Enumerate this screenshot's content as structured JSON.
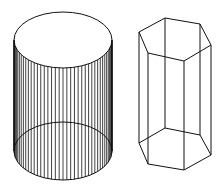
{
  "figure": {
    "width": 219,
    "height": 186,
    "background": "#ffffff",
    "stroke_color": "#111111",
    "shapes": [
      {
        "name": "cylinder",
        "type": "wireframe-cylinder",
        "cx": 63,
        "rx": 49,
        "top": {
          "cy": 40,
          "ry": 28
        },
        "bottom": {
          "cy": 151,
          "ry": 29
        },
        "generator_lines": 40
      },
      {
        "name": "hexagonal-prism",
        "type": "wireframe-hexagonal-prism",
        "top": [
          [
            139,
            32
          ],
          [
            165,
            18
          ],
          [
            200,
            24
          ],
          [
            211,
            45
          ],
          [
            184,
            61
          ],
          [
            148,
            53
          ]
        ],
        "bottom": [
          [
            139,
            143
          ],
          [
            165,
            128
          ],
          [
            200,
            135
          ],
          [
            211,
            155
          ],
          [
            184,
            170
          ],
          [
            148,
            164
          ]
        ],
        "hidden_vertical_index": 1
      }
    ]
  }
}
